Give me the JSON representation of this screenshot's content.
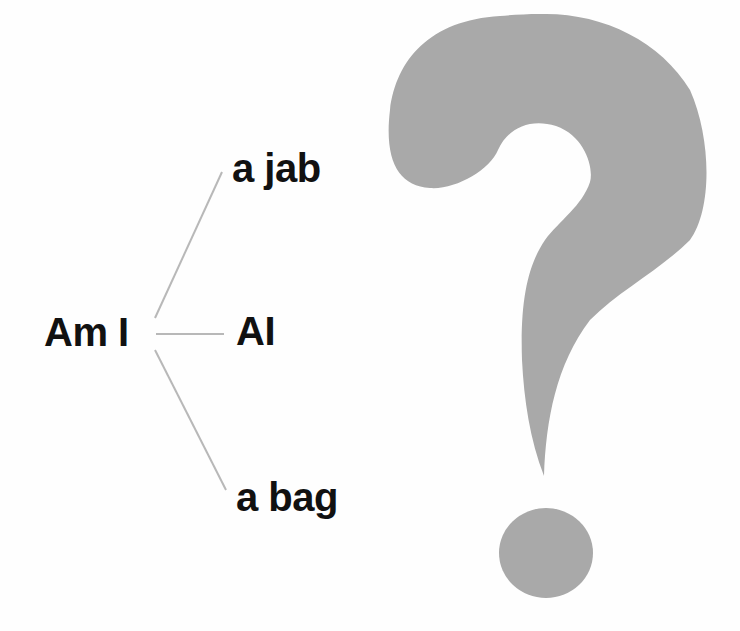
{
  "diagram": {
    "root": {
      "label": "Am I"
    },
    "branches": [
      {
        "label": "a jab"
      },
      {
        "label": "AI"
      },
      {
        "label": "a bag"
      }
    ],
    "connector_color": "#b8b8b8",
    "text_color": "#111111"
  },
  "question_mark": {
    "icon": "question-mark-icon",
    "color": "#a9a9a9"
  }
}
